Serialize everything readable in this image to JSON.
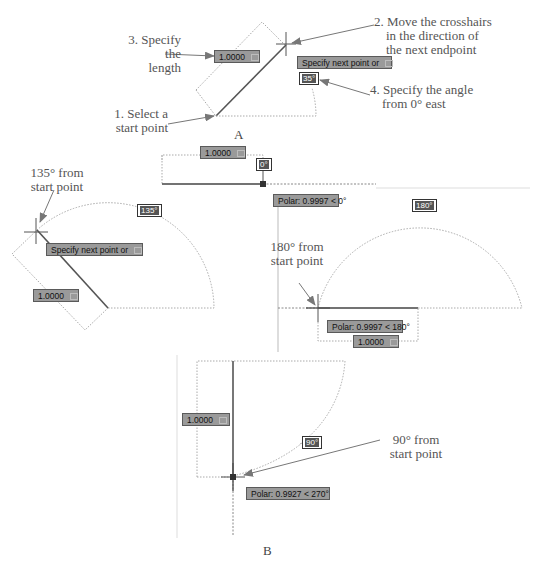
{
  "panels": {
    "A": {
      "caption": "A",
      "length_input": "1.0000",
      "prompt": "Specify next point or",
      "angle_tip": "35°",
      "annotations": {
        "step1": [
          "1. Select a",
          "start point"
        ],
        "step2": [
          "2. Move the crosshairs",
          "in the direction of",
          "the next endpoint"
        ],
        "step3": [
          "3. Specify the",
          "length"
        ],
        "step4": [
          "4. Specify the angle",
          "from 0° east"
        ]
      }
    },
    "B": {
      "caption": "B",
      "zero": {
        "length_input": "1.0000",
        "angle_tip": "0°",
        "polar": "Polar: 0.9997 < 0°"
      },
      "deg135": {
        "annotation": [
          "135° from",
          "start point"
        ],
        "angle_tip": "135°",
        "prompt": "Specify next point or",
        "length_input": "1.0000"
      },
      "deg180": {
        "annotation": [
          "180° from",
          "start point"
        ],
        "angle_tip": "180°",
        "polar": "Polar: 0.9997 < 180°",
        "length_input": "1.0000"
      },
      "deg90": {
        "annotation": [
          "90° from",
          "start point"
        ],
        "angle_tip": "90°",
        "polar": "Polar: 0.9927 < 270°",
        "length_input": "1.0000"
      }
    }
  }
}
